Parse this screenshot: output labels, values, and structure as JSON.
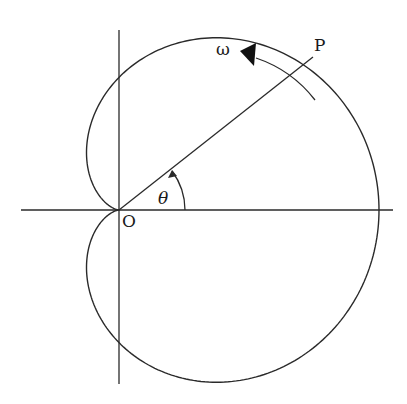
{
  "diagram": {
    "type": "polar cardioid r = a(1 + cos θ)",
    "labels": {
      "origin": "O",
      "point": "P",
      "angle": "θ",
      "angular_velocity": "ω"
    },
    "colors": {
      "stroke": "#2a2a2a",
      "background": "#ffffff"
    }
  }
}
